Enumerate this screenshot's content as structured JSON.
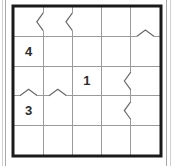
{
  "puzzle": {
    "type": "grid-puzzle",
    "rows": 5,
    "cols": 5,
    "border_color": "#1a1a1a",
    "grid_line_color": "#9a9a9a",
    "mark_color": "#6a6a6a",
    "background_color": "#ffffff",
    "clues": [
      {
        "row": 2,
        "col": 1,
        "value": "4"
      },
      {
        "row": 3,
        "col": 3,
        "value": "1"
      },
      {
        "row": 4,
        "col": 1,
        "value": "3"
      }
    ],
    "marks": [
      {
        "name": "chevron-left-mark",
        "orientation": "vertical",
        "edge_col": 1,
        "row": 1,
        "glyph": "<"
      },
      {
        "name": "chevron-left-mark",
        "orientation": "vertical",
        "edge_col": 2,
        "row": 1,
        "glyph": "<"
      },
      {
        "name": "chevron-up-mark",
        "orientation": "horizontal",
        "edge_row": 1,
        "col": 5,
        "glyph": "^"
      },
      {
        "name": "chevron-left-mark",
        "orientation": "vertical",
        "edge_col": 4,
        "row": 3,
        "glyph": "<"
      },
      {
        "name": "chevron-up-mark",
        "orientation": "horizontal",
        "edge_row": 3,
        "col": 1,
        "glyph": "^"
      },
      {
        "name": "chevron-up-mark",
        "orientation": "horizontal",
        "edge_row": 3,
        "col": 2,
        "glyph": "^"
      },
      {
        "name": "chevron-left-mark",
        "orientation": "vertical",
        "edge_col": 4,
        "row": 4,
        "glyph": "<"
      }
    ]
  }
}
